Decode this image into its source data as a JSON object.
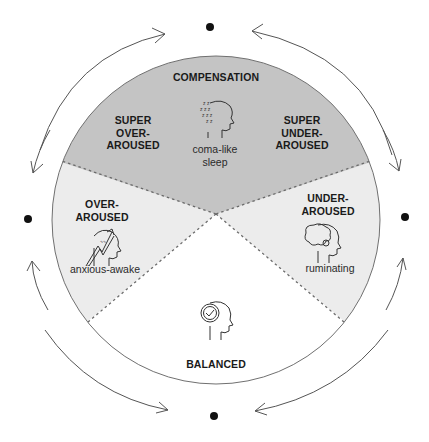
{
  "colors": {
    "compensation_fill": "#c4c4c4",
    "light_fill": "#ececec",
    "balanced_fill": "#ffffff",
    "outline": "#6f6f6f",
    "text": "#1a1a1a"
  },
  "sections": {
    "compensation": {
      "title": "COMPENSATION"
    },
    "super_over_aroused": {
      "line1": "SUPER",
      "line2": "OVER-",
      "line3": "AROUSED"
    },
    "super_under_aroused": {
      "line1": "SUPER",
      "line2": "UNDER-",
      "line3": "AROUSED"
    },
    "coma_like_sleep": {
      "line1": "coma-like",
      "line2": "sleep",
      "icon": "sleeping-head-icon"
    },
    "over_aroused": {
      "line1": "OVER-",
      "line2": "AROUSED",
      "sub": "anxious-awake",
      "icon": "anxious-head-arrow-icon"
    },
    "under_aroused": {
      "line1": "UNDER-",
      "line2": "AROUSED",
      "sub": "ruminating",
      "icon": "brain-head-icon"
    },
    "balanced": {
      "title": "BALANCED",
      "icon": "check-head-icon"
    }
  },
  "cycle": {
    "points": [
      "top",
      "right",
      "bottom",
      "left"
    ],
    "arrows": [
      "top-left-clockwise",
      "top-right-counterclockwise",
      "right-upper-down",
      "right-lower-up",
      "bottom-right-in",
      "bottom-left-in",
      "left-upper-down",
      "left-lower-up"
    ]
  }
}
